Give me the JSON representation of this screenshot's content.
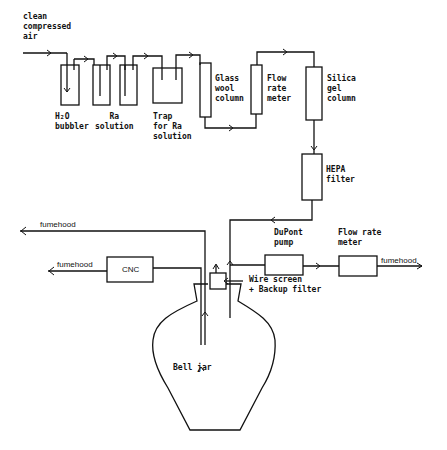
{
  "diagram": {
    "inlet": {
      "label": "clean\ncompressed\nair"
    },
    "components": [
      {
        "id": "h2o-bubbler",
        "label": "H₂O\nbubbler"
      },
      {
        "id": "ra-solution",
        "label": "Ra\nsolution"
      },
      {
        "id": "trap",
        "label": "Trap\nfor Ra\nsolution"
      },
      {
        "id": "glass-wool",
        "label": "Glass\nwool\ncolumn"
      },
      {
        "id": "flow-meter-1",
        "label": "Flow\nrate\nmeter"
      },
      {
        "id": "silica-gel",
        "label": "Silica\ngel\ncolumn"
      },
      {
        "id": "hepa",
        "label": "HEPA\nfilter"
      },
      {
        "id": "dupont-pump",
        "label": "DuPont\npump"
      },
      {
        "id": "flow-meter-2",
        "label": "Flow rate\nmeter"
      },
      {
        "id": "cnc",
        "label": "CNC"
      },
      {
        "id": "wire-screen",
        "label": "Wire screen\n+ Backup filter"
      },
      {
        "id": "bell-jar",
        "label": "Bell jar"
      }
    ],
    "outlets": {
      "fumehood_top": "fumehood",
      "fumehood_cnc": "fumehood",
      "fumehood_right": "fumehood"
    }
  }
}
